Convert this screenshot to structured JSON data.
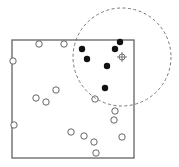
{
  "diagram": {
    "type": "point-neighborhood",
    "colors": {
      "stroke": "#555555",
      "filled": "#111111",
      "dashed": "#777777",
      "background": "#ffffff"
    },
    "square": {
      "x": 12,
      "y": 40,
      "width": 122,
      "height": 118
    },
    "search_circle": {
      "cx": 122,
      "cy": 57,
      "r": 49
    },
    "query_point": {
      "x": 122,
      "y": 57
    },
    "point_radius": 3.2,
    "open_points": [
      [
        39,
        44
      ],
      [
        64,
        44
      ],
      [
        13,
        61
      ],
      [
        56,
        90
      ],
      [
        36,
        98
      ],
      [
        46,
        102
      ],
      [
        95,
        99
      ],
      [
        115,
        111
      ],
      [
        114,
        120
      ],
      [
        14,
        125
      ],
      [
        71,
        132
      ],
      [
        84,
        136
      ],
      [
        122,
        137
      ],
      [
        94,
        142
      ],
      [
        96,
        153
      ]
    ],
    "filled_points": [
      [
        120,
        42
      ],
      [
        82,
        49
      ],
      [
        115,
        49
      ],
      [
        87,
        59
      ],
      [
        107,
        66
      ],
      [
        105,
        88
      ]
    ]
  }
}
